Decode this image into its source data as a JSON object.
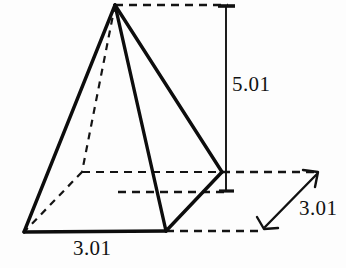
{
  "figure": {
    "shape_name": "square-pyramid",
    "stroke_color": "#111111",
    "background_color": "#fdfdfd",
    "labels": {
      "height": "5.01",
      "base_width": "3.01",
      "base_depth": "3.01"
    },
    "vertices": {
      "apex": [
        115,
        5
      ],
      "front_left": [
        24,
        232
      ],
      "front_right": [
        166,
        231
      ],
      "back_right": [
        222,
        172
      ],
      "back_left_hidden": [
        82,
        172
      ]
    },
    "solid_edges": [
      [
        115,
        5,
        24,
        232
      ],
      [
        115,
        5,
        166,
        231
      ],
      [
        115,
        5,
        222,
        172
      ],
      [
        24,
        232,
        166,
        231
      ],
      [
        166,
        231,
        222,
        172
      ]
    ],
    "hidden_edges": [
      [
        115,
        5,
        82,
        172
      ],
      [
        82,
        172,
        24,
        232
      ],
      [
        82,
        172,
        222,
        172
      ]
    ],
    "extension_lines": [
      [
        115,
        5,
        227,
        5
      ],
      [
        118,
        192,
        228,
        192
      ],
      [
        166,
        231,
        262,
        231
      ],
      [
        222,
        172,
        318,
        172
      ]
    ],
    "dimension_lines": [
      {
        "name": "height-dimension",
        "from": [
          226,
          5
        ],
        "to": [
          226,
          192
        ],
        "terminator": "tick"
      },
      {
        "name": "depth-dimension",
        "from": [
          264,
          228
        ],
        "to": [
          318,
          173
        ],
        "terminator": "arrow"
      }
    ]
  }
}
